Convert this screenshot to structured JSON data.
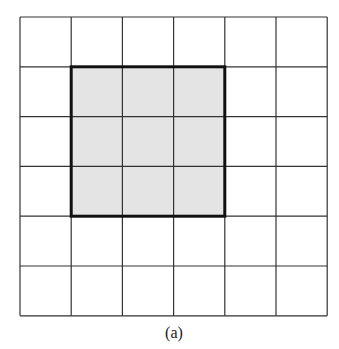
{
  "figure": {
    "caption": "(a)",
    "grid": {
      "rows": 6,
      "cols": 6,
      "origin": [
        20,
        17
      ],
      "cell_w": 51.2,
      "cell_h": 49.8,
      "line_color": "#333333"
    },
    "highlight": {
      "row_start": 1,
      "col_start": 1,
      "rows": 3,
      "cols": 3,
      "fill": "#e4e4e4",
      "border_color": "#111111"
    }
  }
}
